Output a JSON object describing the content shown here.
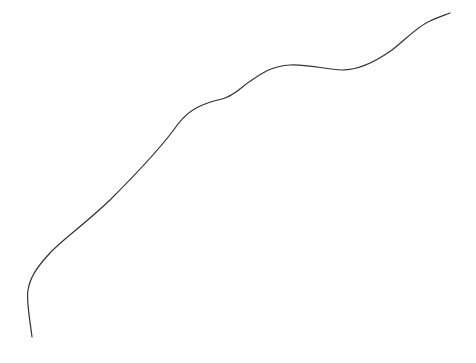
{
  "drawing": {
    "background": "#ffffff",
    "stroke_color": "#333333",
    "stroke_width": 1.2,
    "path": "M 32 337 C 30 320, 26 300, 28 290 C 30 278, 36 268, 50 253 C 62 240, 85 224, 110 200 C 130 180, 160 150, 178 124 C 190 108, 205 103, 222 99 C 235 96, 242 86, 252 80 C 262 73, 272 66, 290 65 C 305 64, 325 69, 342 70 C 360 70, 378 60, 392 50 C 405 40, 418 26, 430 21 C 438 17, 445 15, 450 13"
  }
}
